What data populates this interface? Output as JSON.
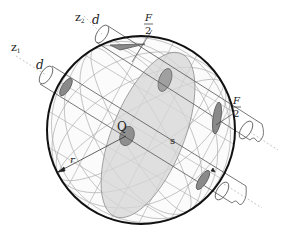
{
  "figure": {
    "colors": {
      "background": "#ffffff",
      "sphere_outline": "#111111",
      "grid_line": "#9a9a9a",
      "cylinder_line": "#555555",
      "section_fill": "#d4d4d4",
      "contact_fill": "#7a7a7a"
    },
    "labels": {
      "z1": "z",
      "z1_sub": "1",
      "z2": "z",
      "z2_sub": "2",
      "d_z1": "d",
      "d_z2": "d",
      "force_top_num": "F",
      "force_top_den": "2",
      "force_right_num": "F",
      "force_right_den": "2",
      "point_q": "Q",
      "distance_s": "s",
      "radius_r": "r"
    }
  }
}
